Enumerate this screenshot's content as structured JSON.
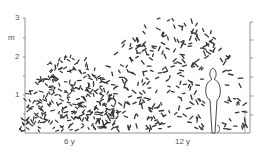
{
  "figure": {
    "y_axis": {
      "unit": "m",
      "ticks": [
        "3",
        "2",
        "1"
      ]
    },
    "x_labels": [
      "6 y",
      "12 y"
    ],
    "elements": [
      "shrub-6-years",
      "shrub-12-years",
      "human-figure-scale"
    ],
    "colors": {
      "ink": "#333333",
      "axis": "#777777",
      "background": "#ffffff"
    }
  }
}
